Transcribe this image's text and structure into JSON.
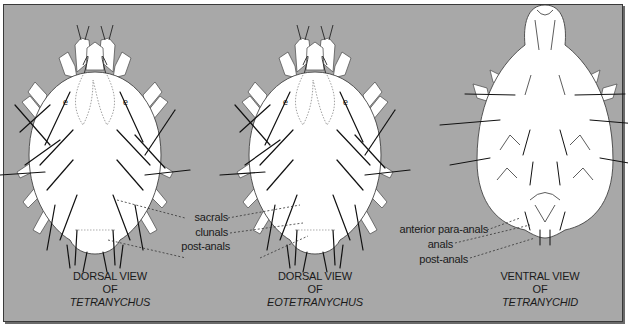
{
  "figure": {
    "background_color": "#a8a8a8",
    "border_color": "#3a3a3a",
    "body_fill": "#ffffff",
    "line_color": "#1a1a1a"
  },
  "panels": [
    {
      "id": "dorsal-tetranychus",
      "caption": {
        "line1": "DORSAL VIEW",
        "line2": "OF",
        "line3": "TETRANYCHUS"
      }
    },
    {
      "id": "dorsal-eotetranychus",
      "caption": {
        "line1": "DORSAL VIEW",
        "line2": "OF",
        "line3": "EOTETRANYCHUS"
      }
    },
    {
      "id": "ventral-tetranychid",
      "caption": {
        "line1": "VENTRAL VIEW",
        "line2": "OF",
        "line3": "TETRANYCHID"
      }
    }
  ],
  "dorsal_labels": {
    "sacrals": "sacrals",
    "clunals": "clunals",
    "post_anals": "post-anals"
  },
  "ventral_labels": {
    "anterior_para_anals": "anterior para-anals",
    "anals": "anals",
    "post_anals": "post-anals"
  }
}
